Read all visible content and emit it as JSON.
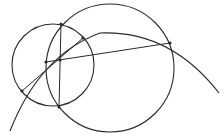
{
  "diagram": {
    "type": "geometric-construction",
    "stroke_color": "#2a2a2a",
    "background": "#ffffff",
    "circles": [
      {
        "id": "small-circle",
        "cx": 53,
        "cy": 65,
        "r": 41
      },
      {
        "id": "large-circle",
        "cx": 110,
        "cy": 68,
        "r": 64
      }
    ],
    "arc": {
      "id": "large-arc",
      "path": "M 10 131 Q 40 55 100 33 Q 170 30 219 93"
    },
    "segments": [
      {
        "id": "vertical-chord",
        "x1": 61,
        "y1": 24,
        "x2": 59,
        "y2": 107
      },
      {
        "id": "diagonal-chord",
        "x1": 22,
        "y1": 91,
        "x2": 83,
        "y2": 38
      },
      {
        "id": "long-chord",
        "x1": 46,
        "y1": 62,
        "x2": 170,
        "y2": 43
      }
    ],
    "points": [
      {
        "id": "top-intersection",
        "x": 61,
        "y": 24
      },
      {
        "id": "bottom-intersection",
        "x": 59,
        "y": 107
      },
      {
        "id": "left-point",
        "x": 22,
        "y": 91
      },
      {
        "id": "upper-right-point",
        "x": 83,
        "y": 38
      },
      {
        "id": "arc-left-point",
        "x": 46,
        "y": 62
      },
      {
        "id": "center-point",
        "x": 60,
        "y": 60
      },
      {
        "id": "right-point",
        "x": 170,
        "y": 43
      }
    ]
  }
}
